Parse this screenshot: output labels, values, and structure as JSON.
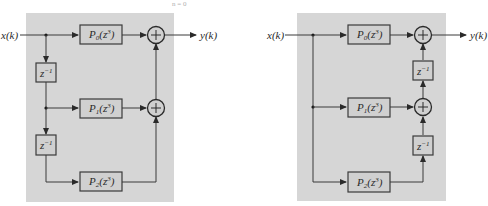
{
  "top_fragment": "n = 0",
  "colors": {
    "panel": "#d6d6d6",
    "line": "#3a3a3a",
    "background": "#ffffff"
  },
  "left_diagram": {
    "input_label": "x(k)",
    "output_label": "y(k)",
    "blocks": [
      {
        "name": "P",
        "sub": "0",
        "arg": "(z",
        "sup": "3",
        "close": ")"
      },
      {
        "name": "P",
        "sub": "1",
        "arg": "(z",
        "sup": "3",
        "close": ")"
      },
      {
        "name": "P",
        "sub": "2",
        "arg": "(z",
        "sup": "3",
        "close": ")"
      }
    ],
    "delays": [
      {
        "base": "z",
        "sup": "−1"
      },
      {
        "base": "z",
        "sup": "−1"
      }
    ],
    "adder_symbol": "+"
  },
  "right_diagram": {
    "input_label": "x(k)",
    "output_label": "y(k)",
    "blocks": [
      {
        "name": "P",
        "sub": "0",
        "arg": "(z",
        "sup": "3",
        "close": ")"
      },
      {
        "name": "P",
        "sub": "1",
        "arg": "(z",
        "sup": "3",
        "close": ")"
      },
      {
        "name": "P",
        "sub": "2",
        "arg": "(z",
        "sup": "3",
        "close": ")"
      }
    ],
    "delays": [
      {
        "base": "z",
        "sup": "−1"
      },
      {
        "base": "z",
        "sup": "−1"
      }
    ],
    "adder_symbol": "+"
  }
}
